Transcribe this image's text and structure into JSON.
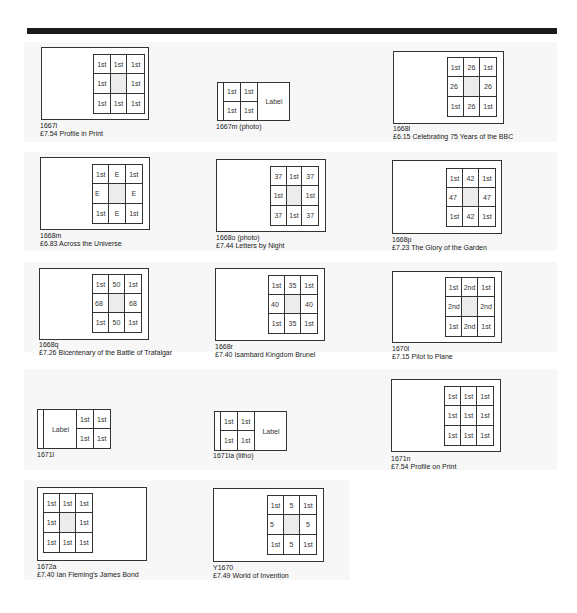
{
  "panels": [
    {
      "code": "1667l",
      "desc": "£7.54 Profile in Print",
      "type": "pane",
      "cells": [
        "1st",
        "1st",
        "1st",
        "1st",
        "",
        "1st",
        "1st",
        "1st",
        "1st"
      ],
      "center_blank": true
    },
    {
      "code": "1667m (photo)",
      "desc": "",
      "type": "strip4",
      "label": "Label",
      "cells": [
        "1st",
        "1st",
        "1st",
        "1st"
      ],
      "label_side": "right"
    },
    {
      "code": "1668l",
      "desc": "£6.15 Celebrating 75 Years of the BBC",
      "type": "pane",
      "cells": [
        "1st",
        "26",
        "1st",
        "26",
        "",
        "26",
        "1st",
        "26",
        "1st"
      ],
      "center_blank": true
    },
    {
      "code": "1668m",
      "desc": "£6.83 Across the Universe",
      "type": "pane",
      "cells": [
        "1st",
        "E",
        "1st",
        "E",
        "",
        "E",
        "1st",
        "E",
        "1st"
      ],
      "center_blank": true
    },
    {
      "code": "1668o (photo)",
      "desc": "£7.44 Letters by Night",
      "type": "pane",
      "cells": [
        "37",
        "1st",
        "37",
        "1st",
        "",
        "1st",
        "37",
        "1st",
        "37"
      ],
      "center_blank": true
    },
    {
      "code": "1668p",
      "desc": "£7.23 The Glory of the Garden",
      "type": "pane",
      "cells": [
        "1st",
        "42",
        "1st",
        "47",
        "",
        "47",
        "1st",
        "42",
        "1st"
      ],
      "center_blank": true
    },
    {
      "code": "1668q",
      "desc": "£7.26 Bicentenary of the Battle of Trafalgar",
      "type": "pane",
      "cells": [
        "1st",
        "50",
        "1st",
        "68",
        "",
        "68",
        "1st",
        "50",
        "1st"
      ],
      "center_blank": true
    },
    {
      "code": "1668r",
      "desc": "£7.40 Isambard Kingdom Brunel",
      "type": "pane",
      "cells": [
        "1st",
        "35",
        "1st",
        "40",
        "",
        "40",
        "1st",
        "35",
        "1st"
      ],
      "center_blank": true
    },
    {
      "code": "1670l",
      "desc": "£7.15 Pilot to Plane",
      "type": "pane",
      "cells": [
        "1st",
        "2nd",
        "1st",
        "2nd",
        "",
        "2nd",
        "1st",
        "2nd",
        "1st"
      ],
      "center_blank": true
    },
    {
      "code": "1671l",
      "desc": "",
      "type": "strip4",
      "label": "Label",
      "cells": [
        "1st",
        "1st",
        "1st",
        "1st"
      ],
      "label_side": "left"
    },
    {
      "code": "1671la (litho)",
      "desc": "",
      "type": "strip4",
      "label": "Label",
      "cells": [
        "1st",
        "1st",
        "1st",
        "1st"
      ],
      "label_side": "right"
    },
    {
      "code": "1671n",
      "desc": "£7.54 Profile on Print",
      "type": "pane",
      "cells": [
        "1st",
        "1st",
        "1st",
        "1st",
        "1st",
        "1st",
        "1st",
        "1st",
        "1st"
      ],
      "center_blank": false
    },
    {
      "code": "1672a",
      "desc": "£7.40 Ian Fleming's James Bond",
      "type": "pane",
      "cells": [
        "1st",
        "1st",
        "1st",
        "1st",
        "",
        "1st",
        "1st",
        "1st",
        "1st"
      ],
      "center_blank": true
    },
    {
      "code": "Y1670",
      "desc": "£7.49 World of Invention",
      "type": "pane",
      "cells": [
        "1st",
        "5",
        "1st",
        "5",
        "",
        "5",
        "1st",
        "5",
        "1st"
      ],
      "center_blank": true
    }
  ]
}
